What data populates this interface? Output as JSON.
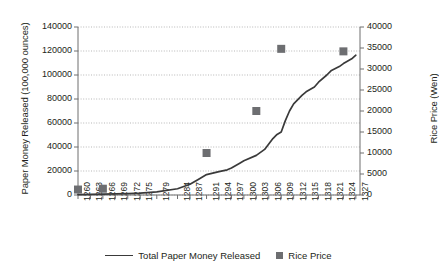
{
  "chart_data": {
    "type": "line",
    "title": "",
    "subtitle": "",
    "xlabel": "",
    "ylabel": "Paper Money Released (100,000 ounces)",
    "y2label": "Rice Price (Wen)",
    "grid": true,
    "legend_position": "bottom",
    "xlim": [
      1260,
      1328
    ],
    "ylim": [
      0,
      140000
    ],
    "y2lim": [
      0,
      40000
    ],
    "yticks": [
      0,
      20000,
      40000,
      60000,
      80000,
      100000,
      120000,
      140000
    ],
    "yticklabels": [
      "0",
      "20000",
      "40000",
      "60000",
      "80000",
      "100000",
      "120000",
      "140000"
    ],
    "y2ticks": [
      0,
      5000,
      10000,
      15000,
      20000,
      25000,
      30000,
      35000,
      40000
    ],
    "y2ticklabels": [
      "0",
      "5000",
      "10000",
      "15000",
      "20000",
      "25000",
      "30000",
      "35000",
      "40000"
    ],
    "xticks": [
      1260,
      1263,
      1266,
      1269,
      1272,
      1275,
      1279,
      1284,
      1287,
      1291,
      1294,
      1297,
      1300,
      1303,
      1306,
      1309,
      1312,
      1315,
      1318,
      1321,
      1324,
      1327
    ],
    "xticklabels": [
      "1260",
      "1263",
      "1266",
      "1269",
      "1272",
      "1275",
      "1279",
      "1284",
      "1287",
      "1291",
      "1294",
      "1297",
      "1300",
      "1303",
      "1306",
      "1309",
      "1312",
      "1315",
      "1318",
      "1321",
      "1324",
      "1327"
    ],
    "series": [
      {
        "name": "Total Paper Money Released",
        "type": "line",
        "axis": "left",
        "color": "#3a3a3a",
        "x": [
          1260,
          1263,
          1266,
          1269,
          1272,
          1275,
          1279,
          1284,
          1287,
          1289,
          1291,
          1294,
          1296,
          1297,
          1299,
          1300,
          1303,
          1305,
          1306,
          1307,
          1308,
          1309,
          1310,
          1311,
          1312,
          1314,
          1315,
          1317,
          1318,
          1320,
          1321,
          1323,
          1324,
          1326,
          1327
        ],
        "values": [
          300,
          500,
          700,
          900,
          1200,
          1600,
          2600,
          5200,
          9000,
          13000,
          17000,
          19500,
          21000,
          22500,
          26500,
          28500,
          33000,
          38000,
          42500,
          47000,
          50500,
          52500,
          62000,
          70000,
          76000,
          83000,
          86000,
          90000,
          94000,
          100000,
          103500,
          107000,
          109500,
          113500,
          116500
        ]
      },
      {
        "name": "Rice Price",
        "type": "scatter",
        "axis": "right",
        "color": "#6d6e71",
        "x": [
          1260,
          1266,
          1291,
          1303,
          1309,
          1324
        ],
        "values": [
          1300,
          1500,
          10000,
          20000,
          34800,
          34200
        ]
      }
    ],
    "legend": [
      {
        "label": "Total Paper Money Released",
        "marker": "line",
        "color": "#3a3a3a"
      },
      {
        "label": "Rice Price",
        "marker": "square",
        "color": "#6d6e71"
      }
    ]
  }
}
